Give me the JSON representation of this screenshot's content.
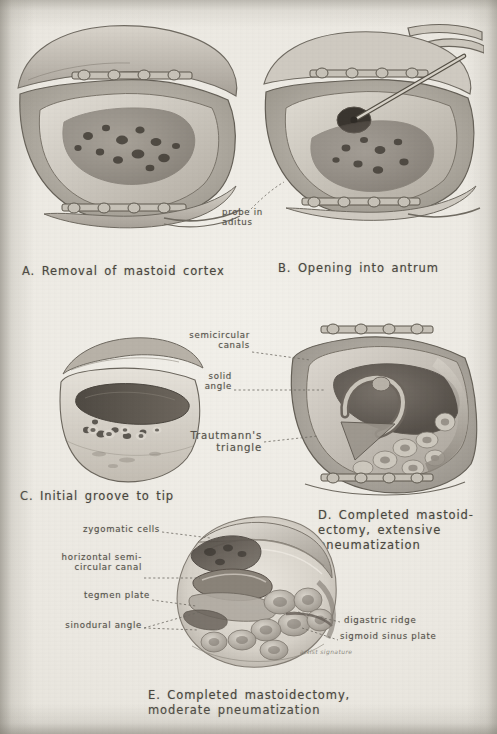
{
  "plate": {
    "kind": "grayscale-medical-illustration-plate",
    "subject": "Mastoidectomy surgical stages",
    "paper_color": "#ebe8e1",
    "ink_color": "#4a4740"
  },
  "panels": [
    {
      "id": "A",
      "caption": "A. Removal of mastoid cortex",
      "description": "Surgical field, mastoid cortex removed, air cells exposed, retractor clips"
    },
    {
      "id": "B",
      "caption": "B. Opening into antrum",
      "description": "Surgical field with probe inserted through antrum into aditus"
    },
    {
      "id": "C",
      "caption": "C. Initial groove to tip",
      "description": "Initial bone groove cut down toward the mastoid tip"
    },
    {
      "id": "D",
      "caption": "D. Completed mastoid-\nectomy, extensive\npneumatization",
      "description": "Completed cavity with extensive pneumatization"
    },
    {
      "id": "E",
      "caption": "E. Completed mastoidectomy,\nmoderate pneumatization",
      "description": "Completed cavity with moderate pneumatization"
    }
  ],
  "labels": {
    "panel_b": [
      {
        "text": "probe in\naditus",
        "name": "probe-in-aditus"
      }
    ],
    "panel_d": [
      {
        "text": "semicircular\ncanals",
        "name": "semicircular-canals"
      },
      {
        "text": "solid\nangle",
        "name": "solid-angle"
      },
      {
        "text": "Trautmann's\ntriangle",
        "name": "trautmanns-triangle"
      }
    ],
    "panel_e_left": [
      {
        "text": "zygomatic cells",
        "name": "zygomatic-cells"
      },
      {
        "text": "horizontal semi-\ncircular canal",
        "name": "horizontal-semicircular-canal"
      },
      {
        "text": "tegmen plate",
        "name": "tegmen-plate"
      },
      {
        "text": "sinodural angle",
        "name": "sinodural-angle"
      }
    ],
    "panel_e_right": [
      {
        "text": "digastric ridge",
        "name": "digastric-ridge"
      },
      {
        "text": "sigmoid sinus plate",
        "name": "sigmoid-sinus-plate"
      }
    ]
  },
  "signature": "artist signature"
}
